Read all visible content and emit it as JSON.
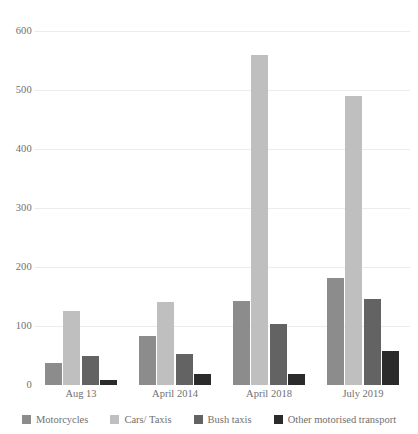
{
  "chart_data": {
    "type": "bar",
    "title": "",
    "subtitle": "",
    "xlabel": "",
    "ylabel": "",
    "categories": [
      "Aug 13",
      "April 2014",
      "April 2018",
      "July 2019"
    ],
    "ylim": [
      0,
      600
    ],
    "yticks": [
      0,
      100,
      200,
      300,
      400,
      500,
      600
    ],
    "ytick_labels": [
      "0",
      "100",
      "200",
      "300",
      "400",
      "500",
      "600"
    ],
    "grid": true,
    "legend_position": "bottom",
    "series": [
      {
        "name": "Motorcycles",
        "color": "#8c8c8c",
        "values": [
          37,
          83,
          143,
          182
        ]
      },
      {
        "name": "Cars/ Taxis",
        "color": "#bfbfbf",
        "values": [
          125,
          141,
          560,
          490
        ]
      },
      {
        "name": "Bush taxis",
        "color": "#636363",
        "values": [
          50,
          52,
          104,
          146
        ]
      },
      {
        "name": "Other motorised transport",
        "color": "#2b2b2b",
        "values": [
          8,
          18,
          19,
          57
        ]
      }
    ]
  },
  "colors": {
    "background": "#ffffff",
    "gridline": "#ececec",
    "text": "#6f6f6f"
  }
}
